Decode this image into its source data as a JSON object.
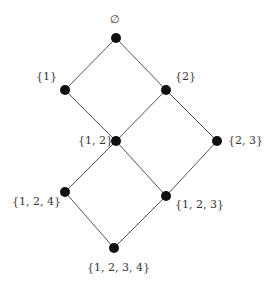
{
  "diagram": {
    "type": "hasse_diagram",
    "nodes": [
      {
        "id": "empty",
        "label": "∅",
        "x": 116,
        "y": 38,
        "lx": 110,
        "ly": 14
      },
      {
        "id": "s1",
        "label": "{1}",
        "x": 65,
        "y": 90,
        "lx": 36,
        "ly": 71
      },
      {
        "id": "s2",
        "label": "{2}",
        "x": 166,
        "y": 90,
        "lx": 175,
        "ly": 71
      },
      {
        "id": "s12",
        "label": "{1, 2}",
        "x": 116,
        "y": 141,
        "lx": 78,
        "ly": 135
      },
      {
        "id": "s23",
        "label": "{2, 3}",
        "x": 217,
        "y": 141,
        "lx": 228,
        "ly": 135
      },
      {
        "id": "s124",
        "label": "{1, 2, 4}",
        "x": 65,
        "y": 192,
        "lx": 12,
        "ly": 196
      },
      {
        "id": "s123",
        "label": "{1, 2, 3}",
        "x": 166,
        "y": 196,
        "lx": 175,
        "ly": 199
      },
      {
        "id": "s1234",
        "label": "{1, 2, 3, 4}",
        "x": 114,
        "y": 248,
        "lx": 87,
        "ly": 262
      }
    ],
    "edges": [
      [
        "empty",
        "s1"
      ],
      [
        "empty",
        "s2"
      ],
      [
        "s1",
        "s12"
      ],
      [
        "s2",
        "s12"
      ],
      [
        "s2",
        "s23"
      ],
      [
        "s12",
        "s124"
      ],
      [
        "s12",
        "s123"
      ],
      [
        "s23",
        "s123"
      ],
      [
        "s124",
        "s1234"
      ],
      [
        "s123",
        "s1234"
      ]
    ],
    "colors": {
      "node": "#111111",
      "edge": "#555555",
      "label": "#333333"
    }
  }
}
